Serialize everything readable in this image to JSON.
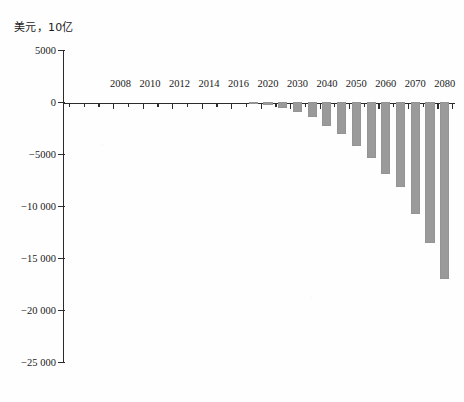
{
  "chart_data": {
    "type": "bar",
    "title": "",
    "subtitle": "",
    "ylabel": "美元，10亿",
    "xlabel": "",
    "ylim": [
      -25000,
      5000
    ],
    "yticks": [
      5000,
      0,
      -5000,
      -10000,
      -15000,
      -20000,
      -25000
    ],
    "ytick_labels": [
      "5000",
      "0",
      "−5000",
      "−10 000",
      "−15 000",
      "−20 000",
      "−25 000"
    ],
    "grid": false,
    "legend": null,
    "bar_color": "#9a9a9a",
    "axis_color": "#2b2b2b",
    "xtick_labels": [
      "2008",
      "2010",
      "2012",
      "2014",
      "2016",
      "2020",
      "2030",
      "2040",
      "2050",
      "2060",
      "2070",
      "2080"
    ],
    "categories": [
      "2005",
      "2006",
      "2007",
      "2008",
      "2009",
      "2010",
      "2011",
      "2012",
      "2013",
      "2014",
      "2015",
      "2016",
      "2017",
      "2020",
      "2025",
      "2030",
      "2035",
      "2040",
      "2045",
      "2050",
      "2055",
      "2060",
      "2065",
      "2070",
      "2075",
      "2080"
    ],
    "values": [
      0,
      0,
      0,
      0,
      0,
      0,
      0,
      0,
      0,
      0,
      0,
      0,
      -30,
      -330,
      -560,
      -990,
      -1420,
      -2300,
      -3100,
      -4200,
      -5400,
      -6900,
      -8200,
      -10800,
      -13600,
      -17000
    ],
    "values_note": "Bars read off axis; negative deficit in billions of US dollars",
    "bars_plotted": [
      {
        "category": "2017",
        "value": -30
      },
      {
        "category": "2020",
        "value": -330
      },
      {
        "category": "2025",
        "value": -560
      },
      {
        "category": "2030",
        "value": -990
      },
      {
        "category": "2035",
        "value": -1420
      },
      {
        "category": "2040",
        "value": -2300
      },
      {
        "category": "2045",
        "value": -3100
      },
      {
        "category": "2050",
        "value": -4200
      },
      {
        "category": "2055",
        "value": -5400
      },
      {
        "category": "2060",
        "value": -6900
      },
      {
        "category": "2065",
        "value": -8200
      },
      {
        "category": "2070",
        "value": -10800
      },
      {
        "category": "2075",
        "value": -13600
      },
      {
        "category": "2080",
        "value": -17000
      }
    ]
  },
  "axis": {
    "y_title": "美元，10亿",
    "y_labels": [
      "5000",
      "0",
      "−5000",
      "−10 000",
      "−15 000",
      "−20 000",
      "−25 000"
    ],
    "x_labels": [
      "2008",
      "2010",
      "2012",
      "2014",
      "2016",
      "2020",
      "2030",
      "2040",
      "2050",
      "2060",
      "2070",
      "2080"
    ]
  }
}
